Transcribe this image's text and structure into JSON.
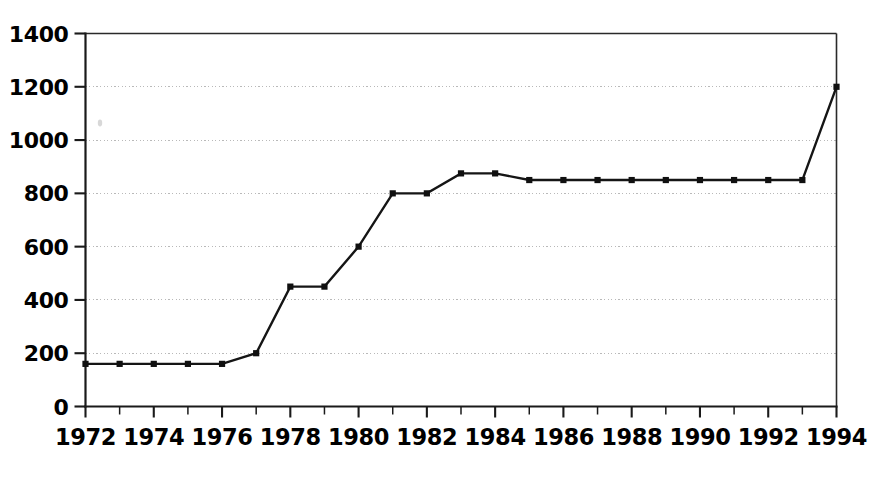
{
  "chart_data": {
    "type": "line",
    "title": "",
    "subtitle": "",
    "xlabel": "",
    "ylabel": "",
    "xlim": [
      1972,
      1994
    ],
    "ylim": [
      0,
      1400
    ],
    "grid": true,
    "legend": "none",
    "y_ticks": [
      0,
      200,
      400,
      600,
      800,
      1000,
      1200,
      1400
    ],
    "y_tick_labels": [
      "0",
      "200",
      "400",
      "600",
      "800",
      "1000",
      "1200",
      "1400"
    ],
    "x_ticks": [
      1972,
      1974,
      1976,
      1978,
      1980,
      1982,
      1984,
      1986,
      1988,
      1990,
      1992,
      1994
    ],
    "x_tick_labels": [
      "1972",
      "1974",
      "1976",
      "1978",
      "1980",
      "1982",
      "1984",
      "1986",
      "1988",
      "1990",
      "1992",
      "1994"
    ],
    "x_minor_ticks": [
      1973,
      1975,
      1977,
      1979,
      1981,
      1983,
      1985,
      1987,
      1989,
      1991,
      1993
    ],
    "x": [
      1972,
      1973,
      1974,
      1975,
      1976,
      1977,
      1978,
      1979,
      1980,
      1981,
      1982,
      1983,
      1984,
      1985,
      1986,
      1987,
      1988,
      1989,
      1990,
      1991,
      1992,
      1993,
      1994
    ],
    "values": [
      160,
      160,
      160,
      160,
      160,
      200,
      450,
      450,
      600,
      800,
      800,
      875,
      875,
      850,
      850,
      850,
      850,
      850,
      850,
      850,
      850,
      850,
      1200
    ],
    "series": [
      {
        "name": "series-1",
        "marker": "square",
        "color": "#101010",
        "values": [
          160,
          160,
          160,
          160,
          160,
          200,
          450,
          450,
          600,
          800,
          800,
          875,
          875,
          850,
          850,
          850,
          850,
          850,
          850,
          850,
          850,
          850,
          1200
        ]
      }
    ],
    "colors": {
      "line": "#101010",
      "marker": "#101010",
      "axis": "#1a1a1a",
      "grid": "#b9b9b9",
      "background": "#ffffff"
    }
  }
}
